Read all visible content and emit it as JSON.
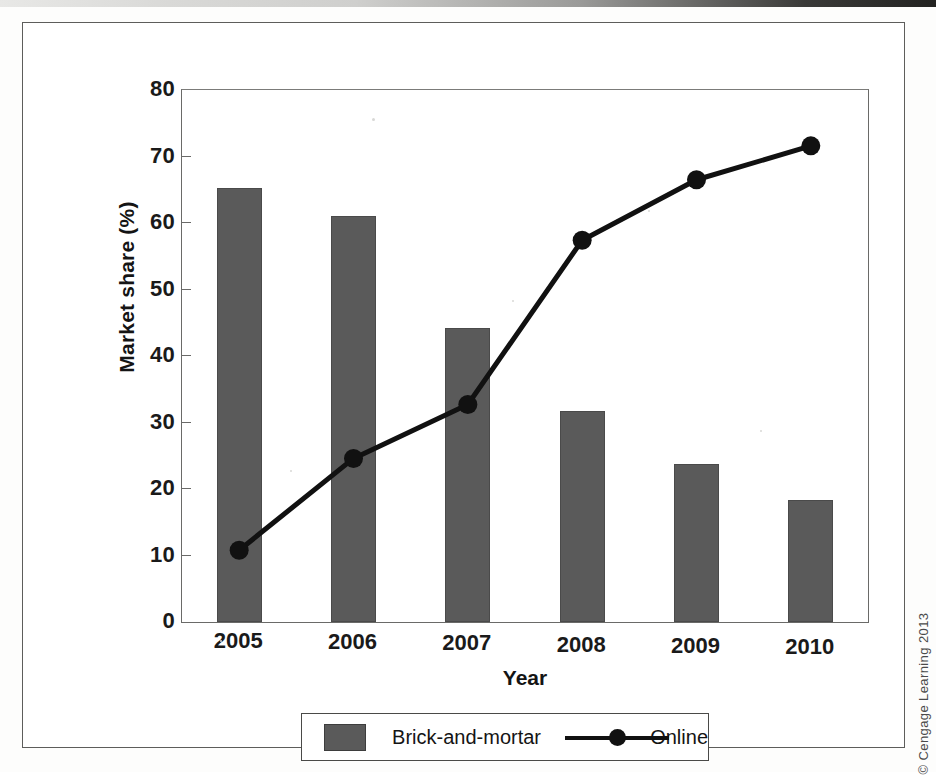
{
  "figure": {
    "copyright": "© Cengage Learning 2013",
    "bar_color": "#5a5a5a",
    "line_color": "#111111"
  },
  "legend": {
    "bar_label": "Brick-and-mortar",
    "line_label": "Online"
  },
  "chart_data": {
    "type": "bar",
    "title": "",
    "xlabel": "Year",
    "ylabel": "Market share (%)",
    "categories": [
      "2005",
      "2006",
      "2007",
      "2008",
      "2009",
      "2010"
    ],
    "ylim": [
      0,
      80
    ],
    "yticks": [
      0,
      10,
      20,
      30,
      40,
      50,
      60,
      70,
      80
    ],
    "ytick_labels": [
      "0",
      "10",
      "20",
      "30",
      "40",
      "50",
      "60",
      "70",
      "80"
    ],
    "grid": false,
    "legend_position": "bottom",
    "series": [
      {
        "name": "Brick-and-mortar",
        "type": "bar",
        "values": [
          65.2,
          61.0,
          44.2,
          31.7,
          23.7,
          18.4
        ]
      },
      {
        "name": "Online",
        "type": "line",
        "values": [
          10.8,
          24.6,
          32.7,
          57.4,
          66.5,
          71.6
        ]
      }
    ]
  }
}
